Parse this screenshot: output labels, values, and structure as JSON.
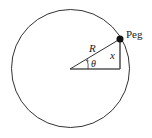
{
  "diagram": {
    "labels": {
      "peg": "Peg",
      "radius": "R",
      "angle": "θ",
      "height": "x"
    },
    "colors": {
      "stroke": "#333333",
      "peg_fill": "#111111",
      "background": "#ffffff"
    }
  }
}
